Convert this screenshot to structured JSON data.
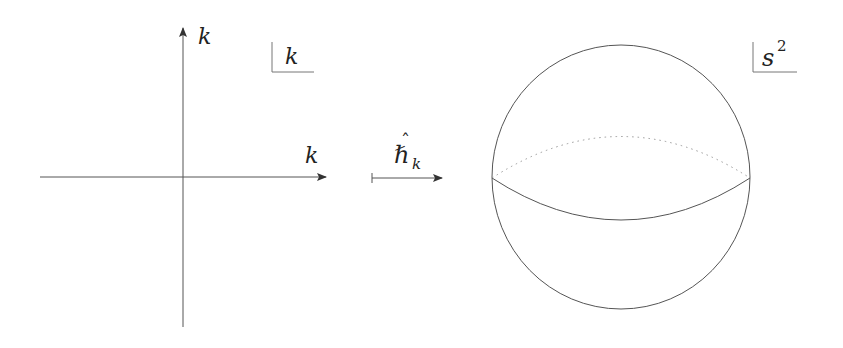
{
  "diagram": {
    "type": "map-from-plane-to-sphere",
    "colors": {
      "stroke": "#555555",
      "dotted": "#999999",
      "text": "#222222",
      "background": "#ffffff"
    },
    "left_panel": {
      "vertical_axis_label": "k",
      "horizontal_axis_label": "k",
      "space_label": "k"
    },
    "map_arrow": {
      "label_base": "ℏ",
      "label_hat": "ˆ",
      "label_subscript": "k"
    },
    "right_panel": {
      "space_label_base": "s",
      "space_label_superscript": "2"
    }
  }
}
